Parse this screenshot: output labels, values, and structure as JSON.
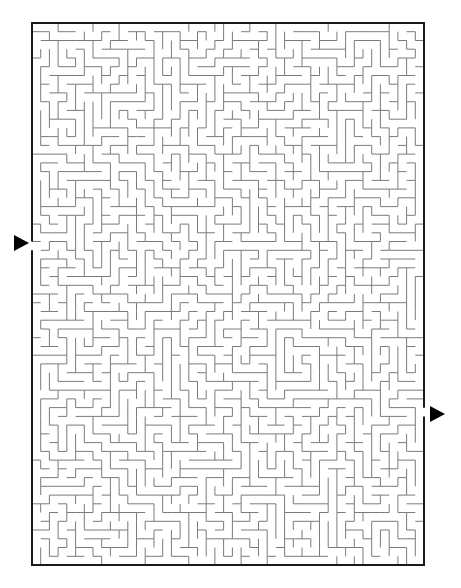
{
  "puzzle": {
    "type": "maze",
    "grid": {
      "cols": 45,
      "rows": 62,
      "cell_px": 8.72
    },
    "frame": {
      "x": 32,
      "y": 23,
      "width": 392,
      "height": 542
    },
    "entrance": {
      "side": "left",
      "row": 25,
      "arrow_x": 14,
      "arrow_y": 235
    },
    "exit": {
      "side": "right",
      "row": 44,
      "arrow_x": 430,
      "arrow_y": 406
    },
    "colors": {
      "background": "#ffffff",
      "border": "#1a1a1a",
      "walls": "#7a7a7a",
      "arrow": "#000000"
    },
    "seed": 4217
  }
}
